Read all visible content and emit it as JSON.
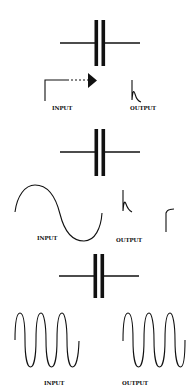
{
  "diagram": {
    "panels": [
      {
        "id": "step",
        "capacitor": {
          "y": 43,
          "x1": 60,
          "x2": 140,
          "plate_top": 20,
          "plate_bottom": 66
        },
        "input": {
          "label": "INPUT",
          "waveform": "step-with-arrow"
        },
        "output": {
          "label": "OUTPUT",
          "waveform": "decaying-spike"
        }
      },
      {
        "id": "low-frequency-sine",
        "capacitor": {
          "y": 152,
          "x1": 60,
          "x2": 140,
          "plate_top": 129,
          "plate_bottom": 176
        },
        "input": {
          "label": "INPUT",
          "waveform": "sine-one-cycle"
        },
        "output": {
          "label": "OUTPUT",
          "waveform": "positive-and-negative-spikes"
        }
      },
      {
        "id": "high-frequency-sine",
        "capacitor": {
          "y": 276,
          "x1": 59,
          "x2": 139,
          "plate_top": 254,
          "plate_bottom": 298
        },
        "input": {
          "label": "INPUT",
          "waveform": "sine-three-cycles"
        },
        "output": {
          "label": "OUTPUT",
          "waveform": "sine-three-cycles"
        }
      }
    ],
    "colors": {
      "ink": "#111111",
      "background": "#ffffff"
    },
    "icons": [
      "capacitor-symbol",
      "arrow-right-icon"
    ]
  }
}
